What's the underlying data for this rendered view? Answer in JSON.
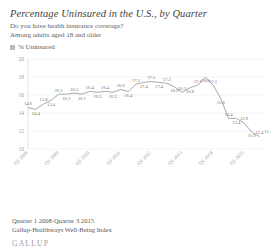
{
  "header": {
    "title": "Percentage Uninsured in the U.S., by Quarter",
    "question": "Do you have health insurance coverage?",
    "population": "Among adults aged 18 and older"
  },
  "legend": {
    "label": "% Uninsured",
    "swatch_color": "#b9bbbd"
  },
  "footer": {
    "range": "Quarter 1 2008-Quarter 3 2015",
    "source": "Gallup-Healthways Well-Being Index",
    "brand": "GALLUP"
  },
  "colors": {
    "line": "#9a9a9c",
    "grid": "#e4e4e6",
    "text": "#58585a",
    "label": "#6e6e70"
  },
  "chart_data": {
    "type": "line",
    "title": "Percentage Uninsured in the U.S., by Quarter",
    "subtitle": "Do you have health insurance coverage? Among adults aged 18 and older",
    "xlabel": "",
    "ylabel": "",
    "ylim": [
      10,
      20
    ],
    "yticks": [
      10,
      12,
      14,
      16,
      18,
      20
    ],
    "ytick_labels": [
      "10",
      "12",
      "14",
      "16",
      "18",
      "20"
    ],
    "grid": true,
    "legend_position": "top-left",
    "series_name": "% Uninsured",
    "categories": [
      "Q1 2008",
      "Q2 2008",
      "Q3 2008",
      "Q4 2008",
      "Q1 2009",
      "Q2 2009",
      "Q3 2009",
      "Q4 2009",
      "Q1 2010",
      "Q2 2010",
      "Q3 2010",
      "Q4 2010",
      "Q1 2011",
      "Q2 2011",
      "Q3 2011",
      "Q4 2011",
      "Q1 2012",
      "Q2 2012",
      "Q3 2012",
      "Q4 2012",
      "Q1 2013",
      "Q2 2013",
      "Q3 2013",
      "Q4 2013",
      "Q1 2014",
      "Q2 2014",
      "Q3 2014",
      "Q4 2014",
      "Q1 2015",
      "Q2 2015",
      "Q3 2015"
    ],
    "values": [
      14.6,
      14.4,
      15.0,
      15.4,
      16.1,
      16.1,
      16.2,
      16.1,
      16.4,
      16.3,
      16.4,
      16.3,
      16.6,
      16.4,
      17.2,
      17.4,
      17.5,
      17.4,
      17.3,
      16.9,
      16.3,
      16.8,
      17.1,
      18.0,
      17.1,
      15.6,
      13.4,
      13.4,
      12.9,
      11.9,
      11.4
    ],
    "point_labels": [
      "14.6",
      "14.4",
      "15.0",
      "15.4",
      "16.1",
      "16.1",
      "16.2",
      "16.1",
      "16.4",
      "16.3",
      "16.4",
      "16.3",
      "16.6",
      "16.4",
      "17.2",
      "17.4",
      "17.5",
      "17.4",
      "17.3",
      "16.9",
      "16.3",
      "16.8",
      "17.1",
      "18.0",
      "17.1",
      "15.6",
      "13.4",
      "13.4",
      "12.9",
      "11.9",
      "11.4"
    ],
    "final_label": "11.6",
    "xtick_labels_shown": [
      "Q1 2008",
      "Q1 2009",
      "Q1 2010",
      "Q1 2011",
      "Q1 2012",
      "Q1 2013",
      "Q1 2014",
      "Q1 2015"
    ]
  }
}
